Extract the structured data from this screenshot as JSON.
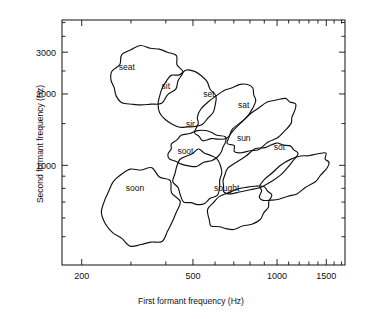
{
  "chart_data": {
    "type": "scatter",
    "title": "",
    "xlabel": "First formant frequency (Hz)",
    "ylabel": "Second formant frequency (Hz)",
    "xscale": "log",
    "yscale": "log",
    "xlim": [
      170,
      1750
    ],
    "ylim": [
      380,
      4100
    ],
    "grid": false,
    "legend": null,
    "x_major_ticks": [
      200,
      500,
      1000,
      1500
    ],
    "x_major_tick_labels": [
      "200",
      "500",
      "1000",
      "1500"
    ],
    "x_minor_ticks": [
      300,
      400,
      600,
      700,
      800,
      900,
      1100,
      1200,
      1300,
      1400,
      1600,
      1700
    ],
    "y_major_ticks": [
      1000,
      2000,
      3000
    ],
    "y_major_tick_labels": [
      "1000",
      "2000",
      "3000"
    ],
    "y_minor_ticks": [
      500,
      600,
      700,
      800,
      900,
      1500,
      2500,
      3500,
      4000
    ],
    "annotations": [
      {
        "label": "seat",
        "f1": 290,
        "f2": 2600
      },
      {
        "label": "sit",
        "f1": 400,
        "f2": 2150
      },
      {
        "label": "set",
        "f1": 570,
        "f2": 2000
      },
      {
        "label": "sat",
        "f1": 760,
        "f2": 1800
      },
      {
        "label": "sir",
        "f1": 490,
        "f2": 1500
      },
      {
        "label": "sun",
        "f1": 760,
        "f2": 1300
      },
      {
        "label": "sot",
        "f1": 1020,
        "f2": 1200
      },
      {
        "label": "soot",
        "f1": 470,
        "f2": 1150
      },
      {
        "label": "soon",
        "f1": 310,
        "f2": 800
      },
      {
        "label": "sought",
        "f1": 660,
        "f2": 800
      }
    ],
    "ellipses": [
      {
        "label": "seat",
        "cx": 146,
        "cy": 76,
        "rx": 35,
        "ry": 29,
        "rot": -20
      },
      {
        "label": "sit",
        "cx": 187,
        "cy": 100,
        "rx": 28,
        "ry": 29,
        "rot": -25
      },
      {
        "label": "set",
        "cx": 225,
        "cy": 113,
        "rx": 35,
        "ry": 20,
        "rot": -42
      },
      {
        "label": "sat",
        "cx": 263,
        "cy": 126,
        "rx": 38,
        "ry": 18,
        "rot": -34
      },
      {
        "label": "sir",
        "cx": 197,
        "cy": 148,
        "rx": 29,
        "ry": 17,
        "rot": -12
      },
      {
        "label": "sun",
        "cx": 258,
        "cy": 168,
        "rx": 41,
        "ry": 18,
        "rot": -27
      },
      {
        "label": "sot",
        "cx": 294,
        "cy": 177,
        "rx": 38,
        "ry": 16,
        "rot": -30
      },
      {
        "label": "soot",
        "cx": 198,
        "cy": 177,
        "rx": 24,
        "ry": 27,
        "rot": 8
      },
      {
        "label": "soon",
        "cx": 141,
        "cy": 207,
        "rx": 37,
        "ry": 39,
        "rot": -8
      },
      {
        "label": "sought",
        "cx": 240,
        "cy": 208,
        "rx": 33,
        "ry": 19,
        "rot": -22
      }
    ]
  }
}
